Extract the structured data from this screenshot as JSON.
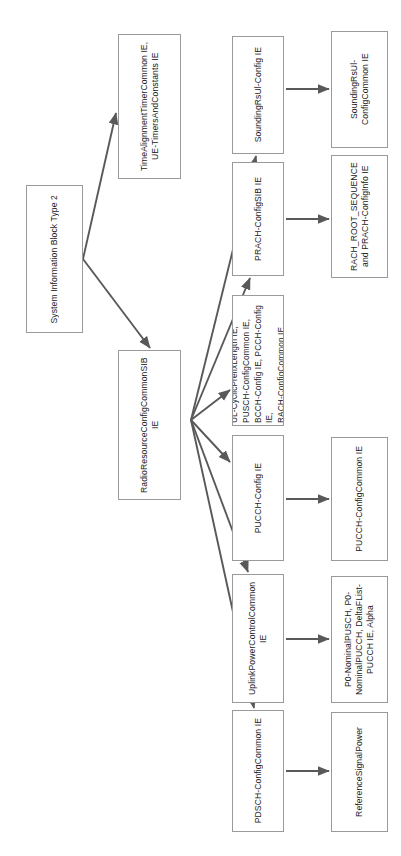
{
  "diagram": {
    "orientation": "rotated-90",
    "colors": {
      "node_border": "#9a9a9a",
      "node_fill": "#ffffff",
      "edge": "#595959",
      "background": "#ffffff",
      "text": "#1a1a1a"
    },
    "nodes": [
      {
        "id": "sib2",
        "label": "System Information Block Type 2",
        "x": 26,
        "y": 185,
        "w": 57,
        "h": 148
      },
      {
        "id": "timealignment",
        "label": "TimeAlignmentTimerCommon IE, UE-TimersAndConstants IE",
        "x": 118,
        "y": 34,
        "w": 63,
        "h": 145
      },
      {
        "id": "radioresource",
        "label": "RadioResourceConfigCommonSIB IE",
        "x": 118,
        "y": 350,
        "w": 63,
        "h": 150
      },
      {
        "id": "soundingrs",
        "label": "SoundingRsUl-Config IE",
        "x": 232,
        "y": 36,
        "w": 52,
        "h": 118
      },
      {
        "id": "soundingrscommon",
        "label": "SoundingRsUl-ConfigCommon IE",
        "x": 331,
        "y": 31,
        "w": 57,
        "h": 117
      },
      {
        "id": "prachsib",
        "label": "PRACH-ConfigSIB IE",
        "x": 232,
        "y": 162,
        "w": 52,
        "h": 114
      },
      {
        "id": "rachroot",
        "label": "RACH_ROOT_SEQUENCE and PRACH-ConfigInfo IE",
        "x": 331,
        "y": 155,
        "w": 57,
        "h": 123
      },
      {
        "id": "ulcyclic",
        "label": "UL-CyclicPrefixLength IE,\nPUSCH-ConfigCommon IE,\nBCCH-Config IE, PCCH-Config IE,\nRACH-ConfigCommon IE",
        "x": 232,
        "y": 295,
        "w": 52,
        "h": 131,
        "multiline": true
      },
      {
        "id": "pucchconfig",
        "label": "PUCCH-Config IE",
        "x": 232,
        "y": 435,
        "w": 52,
        "h": 126
      },
      {
        "id": "pucchcommon",
        "label": "PUCCH-ConfigCommon IE",
        "x": 331,
        "y": 437,
        "w": 57,
        "h": 124
      },
      {
        "id": "uplinkpower",
        "label": "UplinkPowerControlCommon IE",
        "x": 232,
        "y": 574,
        "w": 52,
        "h": 129
      },
      {
        "id": "p0nominal",
        "label": "P0-NominalPUSCH, P0-NominalPUCCH, DeltaFList-PUCCH IE, Alpha",
        "x": 331,
        "y": 576,
        "w": 57,
        "h": 127
      },
      {
        "id": "pdschcommon",
        "label": "PDSCH-ConfigCommon IE",
        "x": 232,
        "y": 710,
        "w": 52,
        "h": 122
      },
      {
        "id": "refsignalpower",
        "label": "ReferenceSignalPower",
        "x": 331,
        "y": 712,
        "w": 57,
        "h": 120
      }
    ],
    "edges": [
      {
        "from": "sib2",
        "to": "timealignment",
        "x1": 83,
        "y1": 259,
        "x2": 116,
        "y2": 113
      },
      {
        "from": "sib2",
        "to": "radioresource",
        "x1": 83,
        "y1": 259,
        "x2": 150,
        "y2": 348
      },
      {
        "from": "radioresource",
        "to": "soundingrs",
        "x1": 191,
        "y1": 420,
        "x2": 256,
        "y2": 156
      },
      {
        "from": "radioresource",
        "to": "prachsib",
        "x1": 191,
        "y1": 420,
        "x2": 250,
        "y2": 278
      },
      {
        "from": "radioresource",
        "to": "ulcyclic",
        "x1": 191,
        "y1": 420,
        "x2": 230,
        "y2": 390
      },
      {
        "from": "radioresource",
        "to": "pucchconfig",
        "x1": 191,
        "y1": 420,
        "x2": 230,
        "y2": 462
      },
      {
        "from": "radioresource",
        "to": "uplinkpower",
        "x1": 191,
        "y1": 420,
        "x2": 248,
        "y2": 572
      },
      {
        "from": "radioresource",
        "to": "pdschcommon",
        "x1": 191,
        "y1": 420,
        "x2": 254,
        "y2": 708
      },
      {
        "from": "soundingrs",
        "to": "soundingrscommon",
        "x1": 286,
        "y1": 89,
        "x2": 329,
        "y2": 89
      },
      {
        "from": "prachsib",
        "to": "rachroot",
        "x1": 286,
        "y1": 219,
        "x2": 329,
        "y2": 219
      },
      {
        "from": "pucchconfig",
        "to": "pucchcommon",
        "x1": 286,
        "y1": 499,
        "x2": 329,
        "y2": 499
      },
      {
        "from": "uplinkpower",
        "to": "p0nominal",
        "x1": 286,
        "y1": 639,
        "x2": 329,
        "y2": 639
      },
      {
        "from": "pdschcommon",
        "to": "refsignalpower",
        "x1": 286,
        "y1": 771,
        "x2": 329,
        "y2": 771
      }
    ]
  }
}
